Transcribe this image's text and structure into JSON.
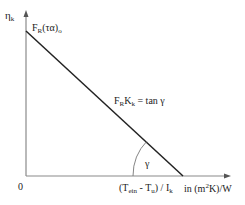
{
  "diagram": {
    "y_axis": {
      "symbol": "η",
      "subscript": "k"
    },
    "x_axis": {
      "origin_label": "0",
      "variable": {
        "open": "(T",
        "sub1": "ein",
        "mid": " - T",
        "sub2": "u",
        "close": ") / I",
        "sub3": "k"
      },
      "unit": {
        "pre": "in (m",
        "sup": "2",
        "post": "K)/W"
      }
    },
    "intercept_label": {
      "main": "F",
      "sub": "R",
      "rest": "(τα)",
      "sub2": "o"
    },
    "slope_label": {
      "f": "F",
      "fsub": "R",
      "k": "K",
      "ksub": "k",
      "rest": " = tan γ"
    },
    "angle_label": "γ",
    "colors": {
      "axis": "#888888",
      "line": "#222222",
      "arc": "#777777"
    }
  }
}
